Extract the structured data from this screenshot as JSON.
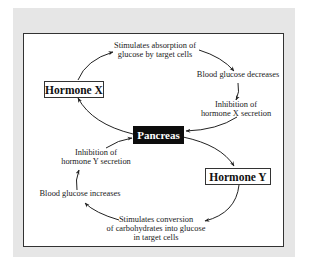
{
  "diagram": {
    "nodes": {
      "hormone_x": "Hormone X",
      "pancreas": "Pancreas",
      "hormone_y": "Hormone Y"
    },
    "steps": {
      "stimulates_absorption": [
        "Stimulates absorption of",
        "glucose by target cells"
      ],
      "blood_glucose_decreases": "Blood glucose decreases",
      "inhibition_x": [
        "Inhibition of",
        "hormone X secretion"
      ],
      "stimulates_conversion": [
        "Stimulates conversion",
        "of carbohydrates into glucose",
        "in target cells"
      ],
      "blood_glucose_increases": "Blood glucose increases",
      "inhibition_y": [
        "Inhibition of",
        "hormone Y secretion"
      ]
    },
    "colors": {
      "frame": "#e6e6e6",
      "panel": "#ffffff",
      "border": "#333333",
      "pancreas_fill": "#0d0d0d",
      "pancreas_text": "#ffffff",
      "arrow": "#222222"
    }
  }
}
